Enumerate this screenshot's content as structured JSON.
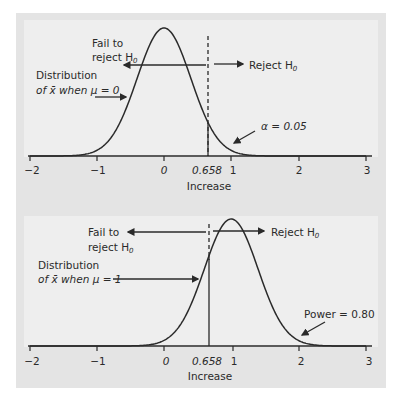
{
  "chart_data": [
    {
      "type": "line",
      "title": "",
      "xlabel": "Increase",
      "ylabel": "",
      "xlim": [
        -2,
        3
      ],
      "x_ticks": [
        "-2",
        "-1",
        "0",
        "0.658",
        "1",
        "2",
        "3"
      ],
      "grid": false,
      "series": [
        {
          "name": "Distribution of x̄ when μ = 0",
          "distribution": "normal",
          "mean": 0,
          "sd": 0.4
        }
      ],
      "critical_value": 0.658,
      "critical_line_style": "dashed",
      "annotations": [
        {
          "text": "Fail to reject H0",
          "arrow": "left"
        },
        {
          "text": "Reject H0",
          "arrow": "right"
        },
        {
          "text": "Distribution of x̄ when μ = 0",
          "arrow": "to curve"
        },
        {
          "text": "α = 0.05",
          "arrow": "to right tail"
        }
      ]
    },
    {
      "type": "line",
      "title": "",
      "xlabel": "Increase",
      "ylabel": "",
      "xlim": [
        -2,
        3
      ],
      "x_ticks": [
        "-2",
        "-1",
        "0",
        "0.658",
        "1",
        "2",
        "3"
      ],
      "grid": false,
      "series": [
        {
          "name": "Distribution of x̄ when μ = 1",
          "distribution": "normal",
          "mean": 1,
          "sd": 0.4
        }
      ],
      "critical_value": 0.658,
      "critical_line_style": "solid below curve, dashed above",
      "annotations": [
        {
          "text": "Fail to reject H0",
          "arrow": "left"
        },
        {
          "text": "Reject H0",
          "arrow": "right"
        },
        {
          "text": "Distribution of x̄ when μ = 1",
          "arrow": "to curve"
        },
        {
          "text": "Power = 0.80",
          "arrow": "to right tail"
        }
      ]
    }
  ],
  "top": {
    "fail_line1": "Fail to",
    "fail_line2": "reject H",
    "reject": "Reject H",
    "h_sub": "0",
    "dist_line1": "Distribution",
    "dist_line2": "of x̄ when μ = 0",
    "alpha": "α = 0.05",
    "xlabel": "Increase",
    "ticks": [
      "−2",
      "−1",
      "0",
      "0.658",
      "1",
      "2",
      "3"
    ]
  },
  "bottom": {
    "fail_line1": "Fail to",
    "fail_line2": "reject H",
    "reject": "Reject H",
    "h_sub": "0",
    "dist_line1": "Distribution",
    "dist_line2": "of x̄ when μ = 1",
    "power": "Power = 0.80",
    "xlabel": "Increase",
    "ticks": [
      "−2",
      "−1",
      "0",
      "0.658",
      "1",
      "2",
      "3"
    ]
  },
  "colors": {
    "frame": "#e4e4e4",
    "panel": "#eeeeee",
    "ink": "#2a2a2a"
  }
}
